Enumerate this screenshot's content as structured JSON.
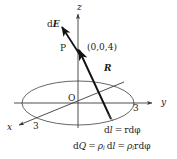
{
  "figure": {
    "background_color": "#ffffff",
    "line_color": "#3a3a3a",
    "vector_color": "#111111",
    "text_color": "#1c1c1c"
  },
  "axes": {
    "z_label": "z",
    "y_label": "y",
    "x_label": "x",
    "origin_label": "O",
    "y_tick_label": "3",
    "x_tick_label": "3"
  },
  "points": {
    "p_label": "P",
    "p_coordinates": "(0,0,4)"
  },
  "vectors": {
    "field_label_d": "d",
    "field_label_E": "E",
    "distance_label_R": "R"
  },
  "equations": {
    "dl": {
      "lhs_d": "d",
      "lhs_l": "l",
      "equals": "=",
      "rhs": "rdφ"
    },
    "dq": {
      "lhs_d": "d",
      "lhs_Q": "Q",
      "equals_1": "=",
      "rho": "ρ",
      "rho_sub": "l",
      "mid_d": "d",
      "mid_l": "l",
      "equals_2": "=",
      "rho2": "ρ",
      "rho2_sub": "l",
      "rhs": "rdφ"
    }
  },
  "geometry": {
    "ellipse_center_x": 78,
    "ellipse_center_y": 103,
    "ellipse_rx": 56,
    "ellipse_ry": 22,
    "z_axis_x": 78,
    "z_axis_top_y": 15,
    "p_point_y": 50,
    "source_point_x": 110,
    "source_point_y": 118
  }
}
